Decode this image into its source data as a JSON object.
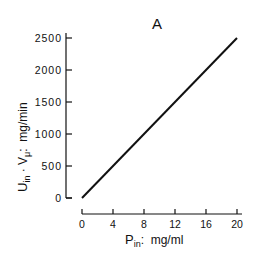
{
  "chart_data": {
    "type": "line",
    "title": "A",
    "xlabel": "P_in: mg/ml",
    "xlabel_main": "P",
    "xlabel_sub": "in",
    "xlabel_units": ":  mg/ml",
    "ylabel": "U_in · V_μ: mg/min",
    "ylabel_main": "U",
    "ylabel_sub": "in",
    "ylabel_mid": " · V",
    "ylabel_sub2": "μ",
    "ylabel_units": ":  mg/min",
    "x_ticks": [
      "0",
      "4",
      "8",
      "12",
      "16",
      "20"
    ],
    "y_ticks": [
      "0",
      "500",
      "1000",
      "1500",
      "2000",
      "2500"
    ],
    "xlim": [
      0,
      20
    ],
    "ylim": [
      0,
      2500
    ],
    "grid": false,
    "legend": null,
    "series": [
      {
        "name": "U_in·V",
        "x": [
          0,
          20
        ],
        "y": [
          0,
          2500
        ]
      }
    ],
    "line_color": "#111111"
  }
}
